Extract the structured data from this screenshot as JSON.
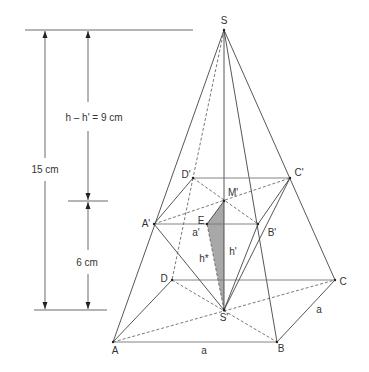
{
  "figure": {
    "type": "frustum-of-square-pyramid-diagram",
    "vertices": {
      "apex": "S",
      "apex_projection": "S'",
      "base": [
        "A",
        "B",
        "C",
        "D"
      ],
      "top_face": [
        "A'",
        "B'",
        "C'",
        "D'"
      ],
      "top_center": "M'",
      "edge_midpoint": "E"
    },
    "labels": {
      "S": "S",
      "S_prime": "S'",
      "A": "A",
      "B": "B",
      "C": "C",
      "D": "D",
      "A_prime": "A'",
      "B_prime": "B'",
      "C_prime": "C'",
      "D_prime": "D'",
      "M_prime": "M'",
      "E": "E",
      "a_prime": "a'",
      "h_prime": "h'",
      "h_star": "h*",
      "a_base_front": "a",
      "a_base_side": "a"
    },
    "dimensions": {
      "total_height": "15 cm",
      "upper_height": "h – h' = 9 cm",
      "lower_height": "6 cm"
    },
    "colors": {
      "line": "#444444",
      "shaded_triangle": "#a8a8a8",
      "background": "#ffffff"
    }
  }
}
